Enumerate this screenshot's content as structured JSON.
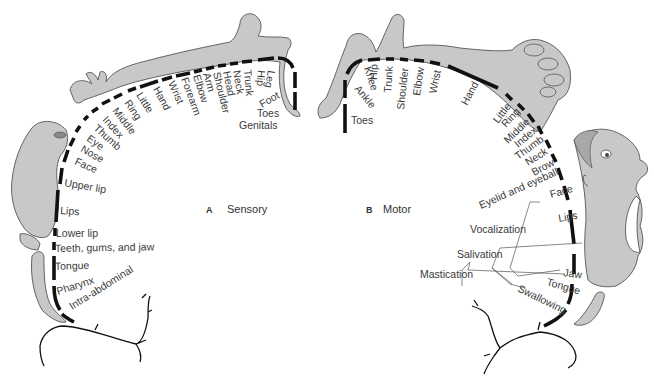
{
  "diagram": {
    "colors": {
      "background": "#ffffff",
      "figure_fill": "#c8c8c8",
      "segment_bars": "#111111",
      "label_text": "#3a3a3a"
    },
    "panels": {
      "sensory": {
        "letter": "A",
        "title": "Sensory",
        "labels": [
          "Leg",
          "Hip",
          "Trunk",
          "Neck",
          "Head",
          "Shoulder",
          "Arm",
          "Elbow",
          "Forearm",
          "Wrist",
          "Hand",
          "Little",
          "Ring",
          "Middle",
          "Index",
          "Thumb",
          "Eye",
          "Nose",
          "Face",
          "Upper lip",
          "Lips",
          "Lower lip",
          "Teeth, gums, and jaw",
          "Tongue",
          "Pharynx",
          "Intra-abdominal",
          "Foot",
          "Toes",
          "Genitals"
        ]
      },
      "motor": {
        "letter": "B",
        "title": "Motor",
        "labels": [
          "Toes",
          "Ankle",
          "Knee",
          "Hip",
          "Trunk",
          "Shoulder",
          "Elbow",
          "Wrist",
          "Hand",
          "Little",
          "Ring",
          "Middle",
          "Index",
          "Thumb",
          "Neck",
          "Brow",
          "Eyelid and eyeball",
          "Face",
          "Lips",
          "Vocalization",
          "Salivation",
          "Mastication",
          "Jaw",
          "Tongue",
          "Swallowing"
        ]
      }
    }
  }
}
